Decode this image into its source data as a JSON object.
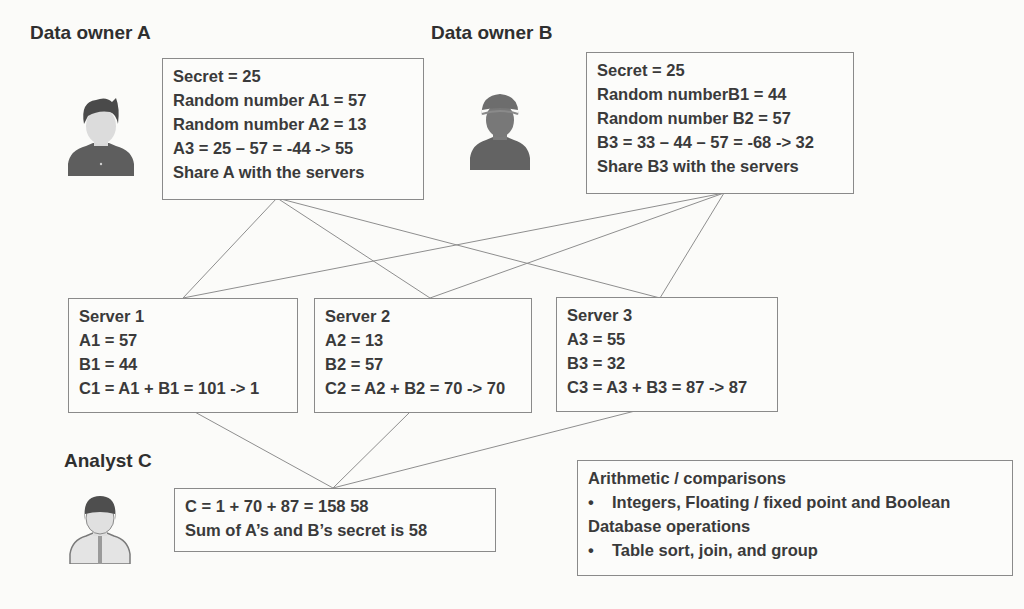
{
  "owner_a": {
    "title": "Data owner A",
    "icon": "person-icon",
    "box_lines": [
      "Secret = 25",
      "Random number A1 = 57",
      "Random number A2 = 13",
      "A3 = 25 – 57 = -44 -> 55",
      "Share A with the servers"
    ]
  },
  "owner_b": {
    "title": "Data owner B",
    "icon": "person-with-helmet-icon",
    "box_lines": [
      "Secret = 25",
      "Random numberB1 = 44",
      "Random number B2 = 57",
      "B3 = 33 – 44 – 57 = -68 -> 32",
      "Share B3 with the servers"
    ]
  },
  "servers": [
    {
      "lines": [
        "Server 1",
        "A1 = 57",
        "B1 = 44",
        "C1 = A1 + B1 = 101 -> 1"
      ]
    },
    {
      "lines": [
        "Server 2",
        "A2 = 13",
        "B2 = 57",
        "C2 = A2 + B2 = 70 -> 70"
      ]
    },
    {
      "lines": [
        "Server 3",
        "A3 = 55",
        "B3 = 32",
        "C3 = A3 + B3 = 87 -> 87"
      ]
    }
  ],
  "analyst": {
    "title": "Analyst C",
    "icon": "person-with-tie-icon",
    "box_lines": [
      "C = 1 + 70 + 87 = 158   58",
      "Sum of A’s and B’s secret is 58"
    ]
  },
  "capabilities": {
    "heading_1": "Arithmetic / comparisons",
    "bullet_1": "Integers, Floating / fixed point and Boolean",
    "heading_2": "Database operations",
    "bullet_2": "Table sort,  join, and group",
    "bullet_glyph": "•"
  },
  "colors": {
    "line": "#8a8a8a",
    "text": "#3a3a3a",
    "icon_dark": "#5a5a5a",
    "icon_light": "#d8d8d8"
  }
}
